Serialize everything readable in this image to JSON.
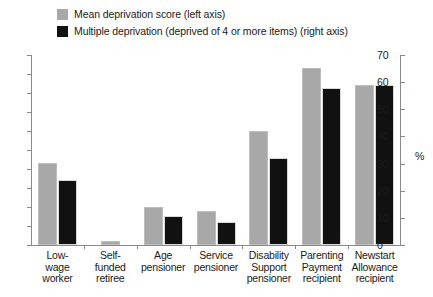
{
  "legend": {
    "items": [
      {
        "label": "Mean deprivation score (left axis)",
        "color": "#a8a8a8",
        "swatch_name": "legend-swatch-mean-deprivation"
      },
      {
        "label": "Multiple deprivation (deprived of 4 or more items) (right axis)",
        "color": "#111111",
        "swatch_name": "legend-swatch-multiple-deprivation"
      }
    ]
  },
  "axes": {
    "left_ticks": [
      "5.0",
      "4.5",
      "4.0",
      "3.5",
      "3.0",
      "2.5",
      "2.0",
      "1.5",
      "1.0",
      "0.5",
      "0"
    ],
    "right_ticks": [
      "70",
      "60",
      "50",
      "40",
      "30",
      "20",
      "10",
      "0"
    ],
    "right_unit": "%"
  },
  "chart_data": {
    "type": "bar",
    "title": "",
    "subtitle": "",
    "xlabel": "",
    "ylabel": "",
    "ylabel_right": "%",
    "grid": false,
    "legend_position": "top-left",
    "ylim": [
      0,
      5.0
    ],
    "ylim_right": [
      0,
      70
    ],
    "categories": [
      "Low-wage worker",
      "Self-funded retiree",
      "Age pensioner",
      "Service pensioner",
      "Disability Support pensioner",
      "Parenting Payment recipient",
      "Newstart Allowance recipient"
    ],
    "category_lines": [
      [
        "Low-",
        "wage",
        "worker"
      ],
      [
        "Self-",
        "funded",
        "retiree"
      ],
      [
        "Age",
        "pensioner"
      ],
      [
        "Service",
        "pensioner"
      ],
      [
        "Disability",
        "Support",
        "pensioner"
      ],
      [
        "Parenting",
        "Payment",
        "recipient"
      ],
      [
        "Newstart",
        "Allowance",
        "recipient"
      ]
    ],
    "series": [
      {
        "name": "Mean deprivation score (left axis)",
        "axis": "left",
        "color": "#a8a8a8",
        "values": [
          2.15,
          0.1,
          1.0,
          0.9,
          3.0,
          4.65,
          4.2
        ]
      },
      {
        "name": "Multiple deprivation (deprived of 4 or more items) (right axis)",
        "axis": "right",
        "color": "#111111",
        "values": [
          24.0,
          0,
          10.5,
          8.5,
          32.0,
          58.0,
          59.0
        ]
      }
    ]
  }
}
